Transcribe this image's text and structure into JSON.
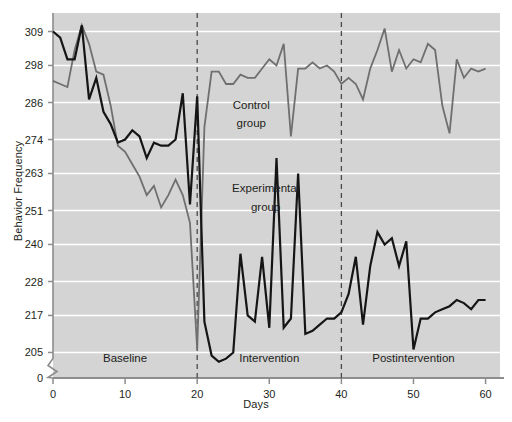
{
  "chart_data": {
    "type": "line",
    "title": "",
    "xlabel": "Days",
    "ylabel": "Behavior Frequency",
    "xlim": [
      0,
      62
    ],
    "ylim": [
      199,
      315
    ],
    "grid": true,
    "grid_axis": "y",
    "legend": "inline-annotations",
    "xticks": [
      0,
      10,
      20,
      30,
      40,
      50,
      60
    ],
    "xticklabels": [
      "0",
      "10",
      "20",
      "30",
      "40",
      "50",
      "60"
    ],
    "yticks": [
      205,
      217,
      228,
      240,
      251,
      263,
      274,
      286,
      298,
      309
    ],
    "yticklabels": [
      "205",
      "217",
      "228",
      "240",
      "251",
      "263",
      "274",
      "286",
      "298",
      "309"
    ],
    "y_zero_label": "0",
    "axis_break": true,
    "plot_background": "#d4d4d4",
    "gridline_color": "#ffffff",
    "axis_color": "#8d8d8d",
    "series": [
      {
        "name": "Control group",
        "color": "#6f6f6f",
        "width": 1.8,
        "x": [
          0,
          1,
          2,
          3,
          4,
          5,
          6,
          7,
          8,
          9,
          10,
          11,
          12,
          13,
          14,
          15,
          16,
          17,
          18,
          19,
          20,
          21,
          22,
          23,
          24,
          25,
          26,
          27,
          28,
          29,
          30,
          31,
          32,
          33,
          34,
          35,
          36,
          37,
          38,
          39,
          40,
          41,
          42,
          43,
          44,
          45,
          46,
          47,
          48,
          49,
          50,
          51,
          52,
          53,
          54,
          55,
          56,
          57,
          58,
          59,
          60
        ],
        "values": [
          293,
          292,
          291,
          303,
          311,
          305,
          296,
          295,
          285,
          272,
          270,
          266,
          262,
          256,
          259,
          252,
          256,
          261,
          256,
          247,
          206,
          278,
          296,
          296,
          292,
          292,
          295,
          294,
          294,
          297,
          300,
          298,
          305,
          275,
          297,
          297,
          299,
          297,
          298,
          296,
          292,
          294,
          292,
          287,
          297,
          303,
          310,
          296,
          303,
          297,
          300,
          299,
          305,
          303,
          285,
          276,
          300,
          294,
          297,
          296,
          297
        ]
      },
      {
        "name": "Experimental group",
        "color": "#151515",
        "width": 2.2,
        "x": [
          0,
          1,
          2,
          3,
          4,
          5,
          6,
          7,
          8,
          9,
          10,
          11,
          12,
          13,
          14,
          15,
          16,
          17,
          18,
          19,
          20,
          21,
          22,
          23,
          24,
          25,
          26,
          27,
          28,
          29,
          30,
          31,
          32,
          33,
          34,
          35,
          36,
          37,
          38,
          39,
          40,
          41,
          42,
          43,
          44,
          45,
          46,
          47,
          48,
          49,
          50,
          51,
          52,
          53,
          54,
          55,
          56,
          57,
          58,
          59,
          60
        ],
        "values": [
          309,
          307,
          300,
          300,
          311,
          287,
          294,
          283,
          279,
          273,
          274,
          277,
          275,
          268,
          273,
          272,
          272,
          274,
          289,
          253,
          288,
          215,
          204,
          202,
          203,
          205,
          237,
          217,
          215,
          236,
          213,
          268,
          213,
          216,
          263,
          211,
          212,
          214,
          216,
          216,
          218,
          224,
          236,
          214,
          233,
          244,
          240,
          242,
          233,
          241,
          206,
          216,
          216,
          218,
          219,
          220,
          222,
          221,
          219,
          222,
          222
        ]
      }
    ],
    "phase_dividers": [
      20,
      40
    ],
    "phase_labels": [
      {
        "text": "Baseline",
        "x": 10,
        "y": 202
      },
      {
        "text": "Intervention",
        "x": 30,
        "y": 202
      },
      {
        "text": "Postintervention",
        "x": 50,
        "y": 202
      }
    ],
    "annotations": [
      {
        "text": "Control",
        "x": 27.5,
        "y": 284
      },
      {
        "text": "group",
        "x": 27.5,
        "y": 278
      },
      {
        "text": "Experimental",
        "x": 29.5,
        "y": 257
      },
      {
        "text": "group",
        "x": 29.5,
        "y": 251
      }
    ]
  }
}
